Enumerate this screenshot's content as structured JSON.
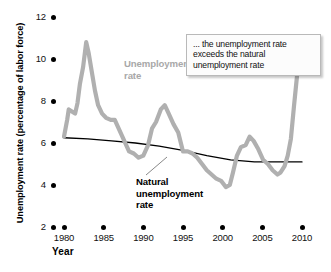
{
  "chart_data": {
    "type": "line",
    "title": "",
    "xlabel": "Year",
    "ylabel": "Unemployment rate (percentage of labor force)",
    "xlim": [
      1979,
      2011
    ],
    "ylim": [
      2,
      12
    ],
    "grid": false,
    "legend_position": "inline-labels",
    "x_ticks": [
      "1980",
      "1985",
      "1990",
      "1995",
      "2000",
      "2005",
      "2010"
    ],
    "y_ticks": [
      "2",
      "4",
      "6",
      "8",
      "10",
      "12"
    ],
    "annotations": [
      {
        "name": "callout",
        "text": "... the unemployment rate exceeds the natural unemployment rate"
      }
    ],
    "series": [
      {
        "name": "Unemployment rate",
        "label": "Unemployment\nrate",
        "color": "#b0b0b0",
        "x": [
          1980.0,
          1980.4,
          1980.6,
          1981.0,
          1981.4,
          1981.7,
          1982.0,
          1982.4,
          1982.8,
          1983.1,
          1983.5,
          1983.9,
          1984.3,
          1984.8,
          1985.3,
          1985.9,
          1986.4,
          1987.0,
          1987.6,
          1988.2,
          1988.8,
          1989.4,
          1990.0,
          1990.6,
          1991.1,
          1991.6,
          1992.2,
          1992.7,
          1993.2,
          1993.8,
          1994.4,
          1995.0,
          1995.6,
          1996.2,
          1996.8,
          1997.4,
          1998.0,
          1998.6,
          1999.2,
          1999.8,
          2000.4,
          2000.9,
          2001.3,
          2001.8,
          2002.3,
          2002.9,
          2003.4,
          2003.9,
          2004.5,
          2005.1,
          2005.7,
          2006.3,
          2006.9,
          2007.3,
          2007.8,
          2008.2,
          2008.6,
          2009.0,
          2009.4,
          2009.8,
          2010.2,
          2010.6
        ],
        "y": [
          6.3,
          7.1,
          7.6,
          7.5,
          7.4,
          7.9,
          8.8,
          9.6,
          10.8,
          10.3,
          9.4,
          8.5,
          7.8,
          7.4,
          7.2,
          7.1,
          7.1,
          6.6,
          6.1,
          5.6,
          5.5,
          5.3,
          5.4,
          5.9,
          6.7,
          7.0,
          7.6,
          7.8,
          7.4,
          6.9,
          6.5,
          5.6,
          5.6,
          5.5,
          5.3,
          5.0,
          4.7,
          4.5,
          4.3,
          4.2,
          3.9,
          4.0,
          4.6,
          5.4,
          5.8,
          5.9,
          6.3,
          6.1,
          5.7,
          5.2,
          5.0,
          4.7,
          4.5,
          4.6,
          4.9,
          5.4,
          6.2,
          7.8,
          9.3,
          10.0,
          9.8,
          9.9
        ]
      },
      {
        "name": "Natural unemployment rate",
        "label": "Natural\nunemployment\nrate",
        "color": "#000000",
        "x": [
          1980,
          1983,
          1986,
          1989,
          1992,
          1995,
          1998,
          2001,
          2004,
          2007,
          2010
        ],
        "y": [
          6.25,
          6.2,
          6.1,
          6.0,
          5.85,
          5.65,
          5.4,
          5.2,
          5.1,
          5.1,
          5.1
        ]
      }
    ]
  },
  "labels": {
    "ylabel": "Unemployment rate (percentage of labor force)",
    "xlabel": "Year",
    "unemployment_line1": "Unemployment",
    "unemployment_line2": "rate",
    "natural_line1": "Natural",
    "natural_line2": "unemployment",
    "natural_line3": "rate",
    "callout_line1": "... the unemployment",
    "callout_line2": "rate exceeds the natural",
    "callout_line3": "unemployment rate"
  },
  "colors": {
    "unemployment": "#b0b0b0",
    "natural": "#000000",
    "unemployment_label": "#a8a8a8",
    "callout_border": "#b9b9b9"
  }
}
